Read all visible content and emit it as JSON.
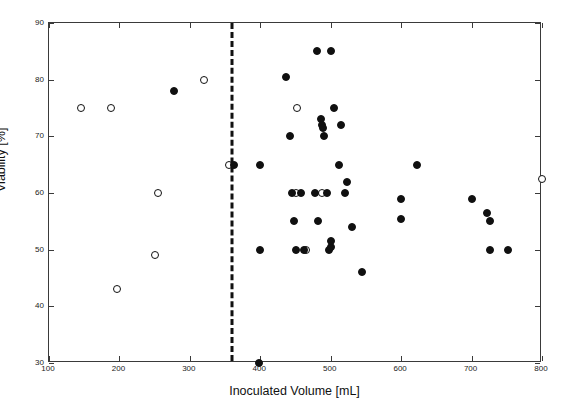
{
  "chart_data": {
    "type": "scatter",
    "title": "",
    "xlabel": "Inoculated Volume [mL]",
    "ylabel": "Viability [%]",
    "xlim": [
      100,
      800
    ],
    "ylim": [
      30,
      90
    ],
    "xticks": [
      100,
      200,
      300,
      400,
      500,
      600,
      700,
      800
    ],
    "yticks": [
      30,
      40,
      50,
      60,
      70,
      80,
      90
    ],
    "xticklabels": [
      "100",
      "200",
      "300",
      "400",
      "500",
      "600",
      "700",
      "800"
    ],
    "yticklabels": [
      "30",
      "40",
      "50",
      "60",
      "70",
      "80",
      "90"
    ],
    "grid": false,
    "legend": "none",
    "annotations": [
      {
        "name": "threshold-line",
        "type": "vertical-dashed-line",
        "x": 360,
        "style": "dashed",
        "color": "#111111"
      }
    ],
    "series": [
      {
        "name": "open-circles",
        "marker": "open-circle",
        "color": "#101010",
        "points": [
          [
            145,
            75.0
          ],
          [
            188,
            75.0
          ],
          [
            197,
            43.0
          ],
          [
            250,
            49.0
          ],
          [
            255,
            60.0
          ],
          [
            320,
            80.0
          ],
          [
            355,
            65.0
          ],
          [
            450,
            60.0
          ],
          [
            452,
            75.0
          ],
          [
            487,
            60.0
          ],
          [
            465,
            50.0
          ],
          [
            800,
            62.5
          ]
        ]
      },
      {
        "name": "filled-circles",
        "marker": "filled-circle",
        "color": "#101010",
        "points": [
          [
            278,
            78.0
          ],
          [
            362,
            65.0
          ],
          [
            398,
            30.0
          ],
          [
            400,
            50.0
          ],
          [
            400,
            65.0
          ],
          [
            437,
            80.5
          ],
          [
            442,
            70.0
          ],
          [
            445,
            60.0
          ],
          [
            448,
            55.0
          ],
          [
            450,
            50.0
          ],
          [
            458,
            60.0
          ],
          [
            462,
            50.0
          ],
          [
            478,
            60.0
          ],
          [
            480,
            85.0
          ],
          [
            482,
            55.0
          ],
          [
            486,
            73.0
          ],
          [
            487,
            72.0
          ],
          [
            489,
            71.5
          ],
          [
            490,
            70.0
          ],
          [
            495,
            60.0
          ],
          [
            497,
            50.0
          ],
          [
            500,
            85.0
          ],
          [
            500,
            50.5
          ],
          [
            501,
            51.5
          ],
          [
            505,
            75.0
          ],
          [
            512,
            65.0
          ],
          [
            514,
            72.0
          ],
          [
            520,
            60.0
          ],
          [
            523,
            62.0
          ],
          [
            530,
            54.0
          ],
          [
            545,
            46.0
          ],
          [
            600,
            55.5
          ],
          [
            600,
            59.0
          ],
          [
            622,
            65.0
          ],
          [
            700,
            59.0
          ],
          [
            722,
            56.5
          ],
          [
            726,
            55.0
          ],
          [
            726,
            50.0
          ],
          [
            752,
            50.0
          ]
        ]
      }
    ]
  }
}
